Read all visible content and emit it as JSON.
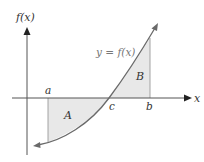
{
  "diagram": {
    "y_axis_label": "f(x)",
    "x_axis_label": "x",
    "curve_label": "y = f(x)",
    "points": {
      "a": "a",
      "b": "b",
      "c": "c"
    },
    "regions": {
      "A": "A",
      "B": "B"
    },
    "colors": {
      "axis": "#555555",
      "curve": "#6a6a6a",
      "fill": "#e8e8e8",
      "boundary": "#9a9a9a",
      "text": "#333333"
    }
  }
}
